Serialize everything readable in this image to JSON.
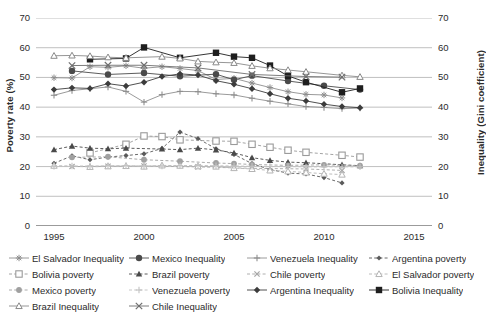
{
  "chart": {
    "type": "line",
    "left_axis_title": "Poverty rate (%)",
    "right_axis_title": "Inequality (Gini coefficient)",
    "xlabel": "",
    "xlim": [
      1994,
      2016
    ],
    "ylim": [
      0,
      70
    ],
    "y_ticks": [
      "0",
      "10",
      "20",
      "30",
      "40",
      "50",
      "60",
      "70"
    ],
    "y_ticks_right": [
      "0",
      "10",
      "20",
      "30",
      "40",
      "50",
      "60",
      "70"
    ],
    "x_ticks": [
      "1995",
      "2000",
      "2005",
      "2010",
      "2015"
    ],
    "grid": true,
    "legend_position": "bottom"
  },
  "chart_data": {
    "type": "line",
    "title": "",
    "xlabel": "",
    "ylabel": "Poverty rate (%)",
    "ylabel_right": "Inequality (Gini coefficient)",
    "xlim": [
      1994,
      2016
    ],
    "ylim": [
      0,
      70
    ],
    "grid": true,
    "legend_position": "bottom",
    "x_ticks": [
      1995,
      2000,
      2005,
      2010,
      2015
    ],
    "y_ticks": [
      0,
      10,
      20,
      30,
      40,
      50,
      60,
      70
    ],
    "series": [
      {
        "name": "El Salvador Inequality",
        "axis": "right",
        "marker": "asterisk",
        "color": "#8e8e8e",
        "dash": "solid",
        "points": [
          [
            1995,
            49.9
          ],
          [
            1996,
            49.8
          ],
          [
            1997,
            53.6
          ],
          [
            1998,
            53.4
          ],
          [
            1999,
            53.9
          ],
          [
            2000,
            53.1
          ],
          [
            2001,
            53.6
          ],
          [
            2002,
            53.0
          ],
          [
            2003,
            52.3
          ],
          [
            2004,
            49.3
          ],
          [
            2005,
            49.7
          ],
          [
            2006,
            48.1
          ],
          [
            2007,
            46.6
          ],
          [
            2008,
            45.2
          ],
          [
            2009,
            44.3
          ],
          [
            2010,
            44.1
          ],
          [
            2011,
            43.1
          ]
        ]
      },
      {
        "name": "Mexico Inequality",
        "axis": "right",
        "marker": "circle",
        "color": "#4a4a4a",
        "dash": "solid",
        "points": [
          [
            1996,
            52.2
          ],
          [
            1998,
            51.0
          ],
          [
            2000,
            51.5
          ],
          [
            2002,
            50.4
          ],
          [
            2004,
            51.1
          ],
          [
            2005,
            49.2
          ],
          [
            2006,
            50.6
          ],
          [
            2008,
            48.8
          ],
          [
            2010,
            47.2
          ],
          [
            2012,
            45.9
          ]
        ]
      },
      {
        "name": "Venezuela Inequality",
        "axis": "right",
        "marker": "plus",
        "color": "#8e8e8e",
        "dash": "solid",
        "points": [
          [
            1995,
            44.0
          ],
          [
            1996,
            45.6
          ],
          [
            1997,
            46.2
          ],
          [
            1998,
            46.8
          ],
          [
            1999,
            45.3
          ],
          [
            2000,
            41.7
          ],
          [
            2001,
            44.2
          ],
          [
            2002,
            45.3
          ],
          [
            2003,
            45.2
          ],
          [
            2004,
            44.5
          ],
          [
            2005,
            44.1
          ],
          [
            2006,
            43.0
          ],
          [
            2007,
            42.0
          ],
          [
            2008,
            41.1
          ],
          [
            2009,
            40.2
          ],
          [
            2010,
            39.9
          ],
          [
            2011,
            39.5
          ],
          [
            2012,
            39.7
          ]
        ]
      },
      {
        "name": "Argentina poverty",
        "axis": "left",
        "marker": "diamond-small",
        "color": "#5a5a5a",
        "dash": "dashed",
        "points": [
          [
            1995,
            21.1
          ],
          [
            1996,
            23.6
          ],
          [
            1997,
            22.3
          ],
          [
            1998,
            23.2
          ],
          [
            1999,
            23.7
          ],
          [
            2000,
            24.3
          ],
          [
            2001,
            26.1
          ],
          [
            2002,
            31.6
          ],
          [
            2003,
            29.4
          ],
          [
            2004,
            26.0
          ],
          [
            2005,
            24.1
          ],
          [
            2006,
            21.0
          ],
          [
            2007,
            19.0
          ],
          [
            2008,
            17.8
          ],
          [
            2009,
            17.5
          ],
          [
            2010,
            16.3
          ],
          [
            2011,
            14.5
          ]
        ]
      },
      {
        "name": "Bolivia poverty",
        "axis": "left",
        "marker": "square-open",
        "color": "#9a9a9a",
        "dash": "dashed",
        "points": [
          [
            1997,
            24.6
          ],
          [
            1999,
            27.5
          ],
          [
            2000,
            30.3
          ],
          [
            2001,
            30.1
          ],
          [
            2002,
            29.0
          ],
          [
            2004,
            28.6
          ],
          [
            2005,
            28.5
          ],
          [
            2006,
            27.5
          ],
          [
            2007,
            26.5
          ],
          [
            2008,
            25.5
          ],
          [
            2009,
            24.8
          ],
          [
            2011,
            23.8
          ],
          [
            2012,
            23.2
          ]
        ]
      },
      {
        "name": "Brazil poverty",
        "axis": "left",
        "marker": "triangle",
        "color": "#4a4a4a",
        "dash": "dashed",
        "points": [
          [
            1995,
            25.7
          ],
          [
            1996,
            26.9
          ],
          [
            1997,
            26.2
          ],
          [
            1998,
            26.0
          ],
          [
            1999,
            26.2
          ],
          [
            2001,
            25.9
          ],
          [
            2002,
            25.7
          ],
          [
            2003,
            26.2
          ],
          [
            2004,
            25.6
          ],
          [
            2005,
            24.6
          ],
          [
            2006,
            23.0
          ],
          [
            2007,
            22.1
          ],
          [
            2008,
            21.5
          ],
          [
            2009,
            21.3
          ],
          [
            2011,
            20.6
          ],
          [
            2012,
            20.3
          ]
        ]
      },
      {
        "name": "Chile poverty",
        "axis": "left",
        "marker": "x-small",
        "color": "#a6a6a6",
        "dash": "dashed",
        "points": [
          [
            1996,
            20.0
          ],
          [
            1998,
            20.1
          ],
          [
            2000,
            20.2
          ],
          [
            2003,
            19.9
          ],
          [
            2006,
            19.4
          ],
          [
            2009,
            19.2
          ],
          [
            2011,
            18.7
          ]
        ]
      },
      {
        "name": "El Salvador poverty",
        "axis": "left",
        "marker": "triangle-open",
        "color": "#b4b4b4",
        "dash": "dashed",
        "points": [
          [
            1995,
            20.3
          ],
          [
            1997,
            19.9
          ],
          [
            1998,
            20.1
          ],
          [
            1999,
            20.2
          ],
          [
            2000,
            20.0
          ],
          [
            2001,
            20.4
          ],
          [
            2002,
            20.3
          ],
          [
            2003,
            20.1
          ],
          [
            2004,
            20.0
          ],
          [
            2005,
            19.5
          ],
          [
            2006,
            19.2
          ],
          [
            2007,
            18.7
          ],
          [
            2008,
            18.4
          ],
          [
            2009,
            18.0
          ],
          [
            2010,
            17.6
          ],
          [
            2011,
            17.3
          ]
        ]
      },
      {
        "name": "Mexico poverty",
        "axis": "left",
        "marker": "circle-grey",
        "color": "#a0a0a0",
        "dash": "dashed",
        "points": [
          [
            1996,
            23.1
          ],
          [
            1998,
            23.3
          ],
          [
            2000,
            22.3
          ],
          [
            2002,
            21.8
          ],
          [
            2004,
            21.2
          ],
          [
            2005,
            21.0
          ],
          [
            2006,
            20.7
          ],
          [
            2008,
            20.4
          ],
          [
            2010,
            20.6
          ],
          [
            2012,
            20.3
          ]
        ]
      },
      {
        "name": "Venezuela poverty",
        "axis": "left",
        "marker": "plus-light",
        "color": "#c2c2c2",
        "dash": "dashed",
        "points": [
          [
            1995,
            20.1
          ],
          [
            1996,
            20.2
          ],
          [
            1997,
            20.2
          ],
          [
            1998,
            20.3
          ],
          [
            1999,
            20.3
          ],
          [
            2000,
            20.2
          ],
          [
            2001,
            20.2
          ],
          [
            2002,
            20.3
          ],
          [
            2003,
            20.4
          ],
          [
            2004,
            20.3
          ],
          [
            2005,
            20.2
          ],
          [
            2006,
            20.1
          ],
          [
            2007,
            20.0
          ],
          [
            2008,
            20.0
          ],
          [
            2009,
            19.9
          ],
          [
            2010,
            19.9
          ],
          [
            2011,
            19.9
          ],
          [
            2012,
            19.9
          ]
        ]
      },
      {
        "name": "Argentina Inequality",
        "axis": "right",
        "marker": "diamond",
        "color": "#3c3c3c",
        "dash": "solid",
        "points": [
          [
            1995,
            45.9
          ],
          [
            1996,
            46.5
          ],
          [
            1997,
            46.3
          ],
          [
            1998,
            47.9
          ],
          [
            1999,
            47.1
          ],
          [
            2000,
            48.4
          ],
          [
            2001,
            50.3
          ],
          [
            2002,
            51.2
          ],
          [
            2003,
            50.8
          ],
          [
            2004,
            48.9
          ],
          [
            2005,
            47.7
          ],
          [
            2006,
            46.2
          ],
          [
            2007,
            44.5
          ],
          [
            2008,
            43.0
          ],
          [
            2009,
            42.1
          ],
          [
            2010,
            41.0
          ],
          [
            2011,
            40.2
          ],
          [
            2012,
            39.8
          ]
        ]
      },
      {
        "name": "Bolivia Inequality",
        "axis": "right",
        "marker": "square",
        "color": "#1e1e1e",
        "dash": "solid",
        "points": [
          [
            1997,
            56.1
          ],
          [
            1999,
            56.4
          ],
          [
            2000,
            60.1
          ],
          [
            2002,
            56.6
          ],
          [
            2004,
            58.3
          ],
          [
            2005,
            57.0
          ],
          [
            2006,
            56.6
          ],
          [
            2007,
            54.0
          ],
          [
            2008,
            50.5
          ],
          [
            2009,
            48.4
          ],
          [
            2011,
            45.0
          ],
          [
            2012,
            46.3
          ]
        ]
      },
      {
        "name": "Brazil Inequality",
        "axis": "right",
        "marker": "triangle-open-lt",
        "color": "#8a8a8a",
        "dash": "solid",
        "points": [
          [
            1995,
            57.3
          ],
          [
            1996,
            57.4
          ],
          [
            1997,
            57.2
          ],
          [
            1998,
            56.8
          ],
          [
            1999,
            56.6
          ],
          [
            2001,
            57.0
          ],
          [
            2002,
            56.4
          ],
          [
            2003,
            55.4
          ],
          [
            2004,
            55.1
          ],
          [
            2005,
            54.9
          ],
          [
            2006,
            53.9
          ],
          [
            2007,
            53.1
          ],
          [
            2008,
            52.5
          ],
          [
            2009,
            51.9
          ],
          [
            2011,
            50.7
          ],
          [
            2012,
            50.2
          ]
        ]
      },
      {
        "name": "Chile Inequality",
        "axis": "right",
        "marker": "x",
        "color": "#6e6e6e",
        "dash": "solid",
        "points": [
          [
            1996,
            54.0
          ],
          [
            1998,
            54.1
          ],
          [
            2000,
            54.1
          ],
          [
            2003,
            53.2
          ],
          [
            2006,
            51.0
          ],
          [
            2009,
            50.3
          ],
          [
            2011,
            50.1
          ]
        ]
      }
    ]
  },
  "legend": {
    "items": [
      {
        "label": "El Salvador Inequality",
        "marker": "asterisk",
        "color": "#8e8e8e",
        "dash": "solid"
      },
      {
        "label": "Mexico Inequality",
        "marker": "circle",
        "color": "#4a4a4a",
        "dash": "solid"
      },
      {
        "label": "Venezuela Inequality",
        "marker": "plus",
        "color": "#8e8e8e",
        "dash": "solid"
      },
      {
        "label": "Argentina poverty",
        "marker": "diamond-small",
        "color": "#5a5a5a",
        "dash": "dashed"
      },
      {
        "label": "Bolivia poverty",
        "marker": "square-open",
        "color": "#9a9a9a",
        "dash": "dashed"
      },
      {
        "label": "Brazil poverty",
        "marker": "triangle",
        "color": "#4a4a4a",
        "dash": "dashed"
      },
      {
        "label": "Chile poverty",
        "marker": "x-small",
        "color": "#a6a6a6",
        "dash": "dashed"
      },
      {
        "label": "El Salvador poverty",
        "marker": "triangle-open",
        "color": "#b4b4b4",
        "dash": "dashed"
      },
      {
        "label": "Mexico poverty",
        "marker": "circle-grey",
        "color": "#a0a0a0",
        "dash": "dashed"
      },
      {
        "label": "Venezuela poverty",
        "marker": "plus-light",
        "color": "#c2c2c2",
        "dash": "dashed"
      },
      {
        "label": "Argentina Inequality",
        "marker": "diamond",
        "color": "#3c3c3c",
        "dash": "solid"
      },
      {
        "label": "Bolivia Inequality",
        "marker": "square",
        "color": "#1e1e1e",
        "dash": "solid"
      },
      {
        "label": "Brazil Inequality",
        "marker": "triangle-open-lt",
        "color": "#8a8a8a",
        "dash": "solid"
      },
      {
        "label": "Chile Inequality",
        "marker": "x",
        "color": "#6e6e6e",
        "dash": "solid"
      }
    ]
  }
}
